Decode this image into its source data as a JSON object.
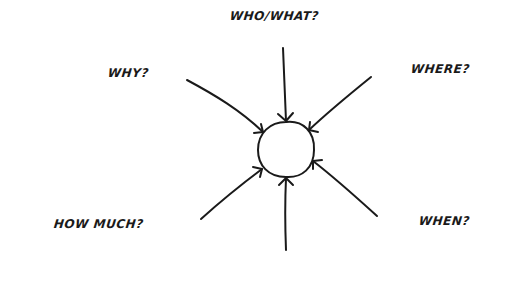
{
  "diagram": {
    "type": "hub-and-spoke",
    "center": {
      "label": ""
    },
    "questions": [
      {
        "id": "who-what",
        "label": "WHO/WHAT?"
      },
      {
        "id": "why",
        "label": "WHY?"
      },
      {
        "id": "where",
        "label": "WHERE?"
      },
      {
        "id": "how-much",
        "label": "HOW MUCH?"
      },
      {
        "id": "when",
        "label": "WHEN?"
      }
    ],
    "colors": {
      "ink": "#1a1a1a",
      "background": "#ffffff"
    }
  }
}
